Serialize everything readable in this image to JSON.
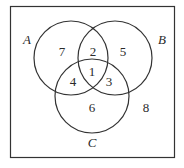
{
  "diagram": {
    "type": "venn",
    "sets": [
      {
        "name": "A",
        "cx": 71,
        "cy": 58,
        "r": 37
      },
      {
        "name": "B",
        "cx": 115,
        "cy": 58,
        "r": 37
      },
      {
        "name": "C",
        "cx": 92,
        "cy": 96,
        "r": 37
      }
    ],
    "set_labels": {
      "A": "A",
      "B": "B",
      "C": "C"
    },
    "regions": {
      "A_only": "7",
      "A_and_B_only": "2",
      "B_only": "5",
      "A_and_C_only": "4",
      "A_and_B_and_C": "1",
      "B_and_C_only": "3",
      "C_only": "6",
      "outside": "8"
    },
    "colors": {
      "line": "#333333",
      "frame": "#333333",
      "background": "#ffffff"
    }
  }
}
